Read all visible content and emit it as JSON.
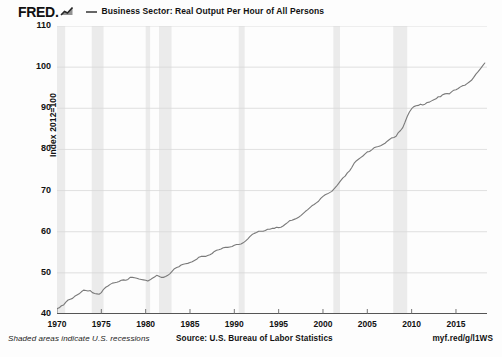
{
  "header": {
    "logo_text": "FRED.",
    "logo_icon": "chart-line-icon",
    "legend_label": "Business Sector: Real Output Per Hour of All Persons",
    "legend_color": "#666666"
  },
  "footer": {
    "recession_note": "Shaded areas indicate U.S. recessions",
    "source": "Source: U.S. Bureau of Labor Statistics",
    "url": "myf.red/g/l1WS"
  },
  "chart_data": {
    "type": "line",
    "title": "Business Sector: Real Output Per Hour of All Persons",
    "xlabel": "",
    "ylabel": "Index 2012=100",
    "ylim": [
      40,
      110
    ],
    "xlim": [
      1970,
      2018.5
    ],
    "yticks": [
      40,
      50,
      60,
      70,
      80,
      90,
      100,
      110
    ],
    "xticks": [
      1970,
      1975,
      1980,
      1985,
      1990,
      1995,
      2000,
      2005,
      2010,
      2015
    ],
    "grid": true,
    "legend_position": "top",
    "line_color": "#7a7a7a",
    "recession_color": "#ebebeb",
    "recessions": [
      {
        "start": 1969.92,
        "end": 1970.92
      },
      {
        "start": 1973.92,
        "end": 1975.25
      },
      {
        "start": 1980.0,
        "end": 1980.5
      },
      {
        "start": 1981.5,
        "end": 1982.92
      },
      {
        "start": 1990.5,
        "end": 1991.17
      },
      {
        "start": 2001.17,
        "end": 2001.92
      },
      {
        "start": 2007.92,
        "end": 2009.5
      }
    ],
    "x": [
      1970.0,
      1970.25,
      1970.5,
      1970.75,
      1971.0,
      1971.25,
      1971.5,
      1971.75,
      1972.0,
      1972.25,
      1972.5,
      1972.75,
      1973.0,
      1973.25,
      1973.5,
      1973.75,
      1974.0,
      1974.25,
      1974.5,
      1974.75,
      1975.0,
      1975.25,
      1975.5,
      1975.75,
      1976.0,
      1976.25,
      1976.5,
      1976.75,
      1977.0,
      1977.25,
      1977.5,
      1977.75,
      1978.0,
      1978.25,
      1978.5,
      1978.75,
      1979.0,
      1979.25,
      1979.5,
      1979.75,
      1980.0,
      1980.25,
      1980.5,
      1980.75,
      1981.0,
      1981.25,
      1981.5,
      1981.75,
      1982.0,
      1982.25,
      1982.5,
      1982.75,
      1983.0,
      1983.25,
      1983.5,
      1983.75,
      1984.0,
      1984.25,
      1984.5,
      1984.75,
      1985.0,
      1985.25,
      1985.5,
      1985.75,
      1986.0,
      1986.25,
      1986.5,
      1986.75,
      1987.0,
      1987.25,
      1987.5,
      1987.75,
      1988.0,
      1988.25,
      1988.5,
      1988.75,
      1989.0,
      1989.25,
      1989.5,
      1989.75,
      1990.0,
      1990.25,
      1990.5,
      1990.75,
      1991.0,
      1991.25,
      1991.5,
      1991.75,
      1992.0,
      1992.25,
      1992.5,
      1992.75,
      1993.0,
      1993.25,
      1993.5,
      1993.75,
      1994.0,
      1994.25,
      1994.5,
      1994.75,
      1995.0,
      1995.25,
      1995.5,
      1995.75,
      1996.0,
      1996.25,
      1996.5,
      1996.75,
      1997.0,
      1997.25,
      1997.5,
      1997.75,
      1998.0,
      1998.25,
      1998.5,
      1998.75,
      1999.0,
      1999.25,
      1999.5,
      1999.75,
      2000.0,
      2000.25,
      2000.5,
      2000.75,
      2001.0,
      2001.25,
      2001.5,
      2001.75,
      2002.0,
      2002.25,
      2002.5,
      2002.75,
      2003.0,
      2003.25,
      2003.5,
      2003.75,
      2004.0,
      2004.25,
      2004.5,
      2004.75,
      2005.0,
      2005.25,
      2005.5,
      2005.75,
      2006.0,
      2006.25,
      2006.5,
      2006.75,
      2007.0,
      2007.25,
      2007.5,
      2007.75,
      2008.0,
      2008.25,
      2008.5,
      2008.75,
      2009.0,
      2009.25,
      2009.5,
      2009.75,
      2010.0,
      2010.25,
      2010.5,
      2010.75,
      2011.0,
      2011.25,
      2011.5,
      2011.75,
      2012.0,
      2012.25,
      2012.5,
      2012.75,
      2013.0,
      2013.25,
      2013.5,
      2013.75,
      2014.0,
      2014.25,
      2014.5,
      2014.75,
      2015.0,
      2015.25,
      2015.5,
      2015.75,
      2016.0,
      2016.25,
      2016.5,
      2016.75,
      2017.0,
      2017.25,
      2017.5,
      2017.75,
      2018.0,
      2018.25
    ],
    "values": [
      41.3,
      41.5,
      42.0,
      42.2,
      42.9,
      43.4,
      43.6,
      43.8,
      44.3,
      44.6,
      44.9,
      45.4,
      45.8,
      45.7,
      45.6,
      45.7,
      45.2,
      45.0,
      44.9,
      44.8,
      45.2,
      46.0,
      46.5,
      46.8,
      47.2,
      47.5,
      47.6,
      47.7,
      47.9,
      48.2,
      48.3,
      48.2,
      48.4,
      48.9,
      48.9,
      48.8,
      48.7,
      48.5,
      48.4,
      48.3,
      48.2,
      48.0,
      48.3,
      48.7,
      49.0,
      49.4,
      49.2,
      48.9,
      48.9,
      49.1,
      49.4,
      49.8,
      50.4,
      51.0,
      51.3,
      51.5,
      51.9,
      52.1,
      52.2,
      52.3,
      52.5,
      52.7,
      53.0,
      53.3,
      53.8,
      54.0,
      54.0,
      54.0,
      54.2,
      54.4,
      54.7,
      55.2,
      55.5,
      55.6,
      55.8,
      56.1,
      56.2,
      56.2,
      56.3,
      56.4,
      56.7,
      56.9,
      56.9,
      57.0,
      57.3,
      57.7,
      58.2,
      58.8,
      59.3,
      59.6,
      59.8,
      60.1,
      60.1,
      60.1,
      60.3,
      60.6,
      60.6,
      60.8,
      60.8,
      61.1,
      61.0,
      61.1,
      61.4,
      61.8,
      62.2,
      62.7,
      62.8,
      63.0,
      63.2,
      63.5,
      63.9,
      64.4,
      64.9,
      65.3,
      65.8,
      66.3,
      66.6,
      67.0,
      67.4,
      68.1,
      68.6,
      69.0,
      69.2,
      69.5,
      69.8,
      70.4,
      71.0,
      71.7,
      72.4,
      73.1,
      73.5,
      74.3,
      74.8,
      75.6,
      76.6,
      77.2,
      77.6,
      78.0,
      78.4,
      78.9,
      79.4,
      79.5,
      79.9,
      80.4,
      80.6,
      80.7,
      80.9,
      81.2,
      81.5,
      82.0,
      82.4,
      82.8,
      82.9,
      83.2,
      84.1,
      84.6,
      85.3,
      86.6,
      88.0,
      89.1,
      89.9,
      90.4,
      90.6,
      90.7,
      91.0,
      90.8,
      91.0,
      91.4,
      91.5,
      91.8,
      92.1,
      92.3,
      92.8,
      92.8,
      93.3,
      93.5,
      93.6,
      93.5,
      94.0,
      94.4,
      94.5,
      94.8,
      95.2,
      95.5,
      95.6,
      96.0,
      96.4,
      96.8,
      97.5,
      98.3,
      98.9,
      99.6,
      100.3,
      101.0
    ]
  }
}
